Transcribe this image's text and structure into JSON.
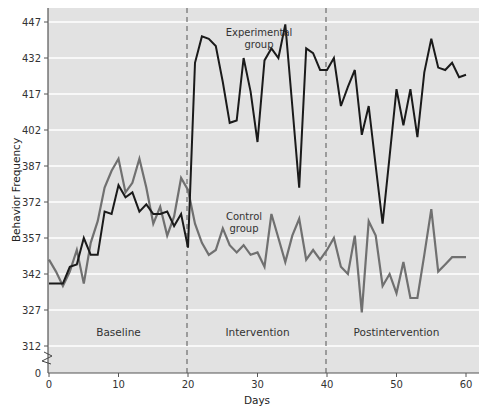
{
  "chart_data": {
    "type": "line",
    "title": "",
    "xlabel": "Days",
    "ylabel": "Behavior Frequency",
    "xlim": [
      0,
      62
    ],
    "ylim": [
      312,
      447
    ],
    "y_axis_break": true,
    "y_origin_label": "0",
    "x_ticks": [
      0,
      10,
      20,
      30,
      40,
      50,
      60
    ],
    "y_ticks": [
      312,
      327,
      342,
      357,
      372,
      387,
      402,
      417,
      432,
      447
    ],
    "grid": "horizontal",
    "phase_dividers": [
      20,
      40
    ],
    "phases": [
      {
        "label": "Baseline",
        "center_day": 10
      },
      {
        "label": "Intervention",
        "center_day": 30
      },
      {
        "label": "Postintervention",
        "center_day": 50
      }
    ],
    "x": [
      0,
      1,
      2,
      3,
      4,
      5,
      6,
      7,
      8,
      9,
      10,
      11,
      12,
      13,
      14,
      15,
      16,
      17,
      18,
      19,
      20,
      21,
      22,
      23,
      24,
      25,
      26,
      27,
      28,
      29,
      30,
      31,
      32,
      33,
      34,
      35,
      36,
      37,
      38,
      39,
      40,
      41,
      42,
      43,
      44,
      45,
      46,
      47,
      48,
      49,
      50,
      51,
      52,
      53,
      54,
      55,
      56,
      57,
      58,
      59,
      60
    ],
    "series": [
      {
        "name": "Experimental group",
        "label_lines": [
          "Experimental",
          "group"
        ],
        "color": "#1a1a1a",
        "values": [
          338,
          338,
          338,
          345,
          346,
          357,
          350,
          350,
          368,
          367,
          379,
          374,
          376,
          368,
          371,
          367,
          367,
          368,
          362,
          367,
          353,
          430,
          441,
          440,
          437,
          422,
          405,
          406,
          432,
          418,
          397,
          431,
          436,
          432,
          446,
          412,
          378,
          436,
          434,
          427,
          427,
          432,
          412,
          420,
          427,
          400,
          412,
          387,
          363,
          391,
          419,
          404,
          419,
          399,
          426,
          440,
          428,
          427,
          430,
          424,
          425
        ]
      },
      {
        "name": "Control group",
        "label_lines": [
          "Control",
          "group"
        ],
        "color": "#707070",
        "values": [
          348,
          343,
          337,
          343,
          352,
          338,
          355,
          364,
          378,
          385,
          390,
          376,
          380,
          390,
          378,
          363,
          370,
          358,
          366,
          382,
          377,
          363,
          355,
          350,
          352,
          361,
          354,
          351,
          354,
          350,
          351,
          345,
          367,
          357,
          347,
          358,
          365,
          348,
          352,
          348,
          352,
          357,
          345,
          342,
          358,
          326,
          364,
          358,
          337,
          342,
          334,
          347,
          332,
          332,
          350,
          369,
          343,
          346,
          349,
          349,
          349
        ]
      }
    ]
  }
}
